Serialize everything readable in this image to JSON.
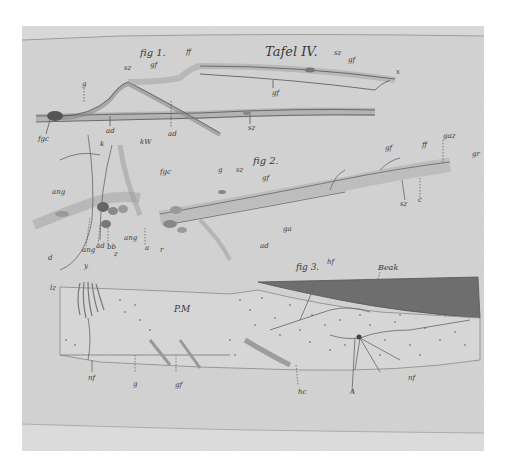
{
  "plate": {
    "title": "Tafel IV.",
    "colors": {
      "background": "#ffffff",
      "paper": "#d2d2d2",
      "paper_top_band": "#cfcfcf",
      "paper_bottom_band": "#d9d9d9",
      "ink": "#3a3a3a",
      "wedge": "#6e6e6e"
    }
  },
  "fig1": {
    "label": "fig 1.",
    "labels": [
      "gf",
      "ff",
      "sz",
      "gf",
      "x",
      "sz",
      "g",
      "gf",
      "fgc",
      "ad",
      "ad",
      "sz"
    ]
  },
  "fig2": {
    "label": "fig 2.",
    "labels": [
      "g",
      "sz",
      "gf",
      "gf",
      "ff",
      "gaz",
      "gr",
      "sz",
      "c",
      "ga",
      "ad"
    ]
  },
  "fig_left": {
    "labels": [
      "k",
      "kW",
      "fgc",
      "ang",
      "d",
      "ang",
      "ad",
      "bb",
      "z",
      "y",
      "ang",
      "r",
      "a"
    ]
  },
  "fig3": {
    "label": "fig 3.",
    "labels": [
      "hf",
      "Beak",
      "P.M",
      "lz",
      "nf",
      "g",
      "gf",
      "hc",
      "A",
      "nf"
    ]
  }
}
